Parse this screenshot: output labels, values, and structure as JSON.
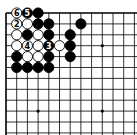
{
  "board": {
    "type": "go-diagram",
    "origin": {
      "x": 6,
      "y": 13
    },
    "spacing": {
      "x": 10.7,
      "y": 10.9
    },
    "columns_visible": 13,
    "rows_visible": 12,
    "edges": {
      "top": true,
      "left": true,
      "right": false,
      "bottom": false
    },
    "star_points": [
      {
        "col": 3,
        "row": 3
      },
      {
        "col": 9,
        "row": 3
      },
      {
        "col": 3,
        "row": 9
      },
      {
        "col": 9,
        "row": 9
      }
    ],
    "colors": {
      "line": "#000000",
      "black": "#000000",
      "white": "#ffffff",
      "background": "#ffffff"
    },
    "stones": [
      {
        "col": 1,
        "row": 0,
        "color": "white",
        "label": "6"
      },
      {
        "col": 2,
        "row": 0,
        "color": "black",
        "label": "5"
      },
      {
        "col": 3,
        "row": 0,
        "color": "black",
        "label": ""
      },
      {
        "col": 1,
        "row": 1,
        "color": "white",
        "label": "2"
      },
      {
        "col": 2,
        "row": 1,
        "color": "white",
        "label": ""
      },
      {
        "col": 3,
        "row": 1,
        "color": "black",
        "label": ""
      },
      {
        "col": 4,
        "row": 1,
        "color": "black",
        "label": ""
      },
      {
        "col": 7,
        "row": 1,
        "color": "black",
        "label": ""
      },
      {
        "col": 1,
        "row": 2,
        "color": "white",
        "label": ""
      },
      {
        "col": 2,
        "row": 2,
        "color": "black",
        "label": ""
      },
      {
        "col": 3,
        "row": 2,
        "color": "white",
        "label": ""
      },
      {
        "col": 4,
        "row": 2,
        "color": "black",
        "label": ""
      },
      {
        "col": 6,
        "row": 2,
        "color": "black",
        "label": ""
      },
      {
        "col": 1,
        "row": 3,
        "color": "white",
        "label": ""
      },
      {
        "col": 2,
        "row": 3,
        "color": "white",
        "label": "4"
      },
      {
        "col": 3,
        "row": 3,
        "color": "white",
        "label": ""
      },
      {
        "col": 4,
        "row": 3,
        "color": "black",
        "label": "3"
      },
      {
        "col": 5,
        "row": 3,
        "color": "white",
        "label": ""
      },
      {
        "col": 6,
        "row": 3,
        "color": "black",
        "label": ""
      },
      {
        "col": 1,
        "row": 4,
        "color": "black",
        "label": ""
      },
      {
        "col": 2,
        "row": 4,
        "color": "white",
        "label": ""
      },
      {
        "col": 3,
        "row": 4,
        "color": "white",
        "label": ""
      },
      {
        "col": 4,
        "row": 4,
        "color": "black",
        "label": ""
      },
      {
        "col": 6,
        "row": 4,
        "color": "black",
        "label": ""
      },
      {
        "col": 1,
        "row": 5,
        "color": "black",
        "label": ""
      },
      {
        "col": 2,
        "row": 5,
        "color": "black",
        "label": ""
      },
      {
        "col": 3,
        "row": 5,
        "color": "black",
        "label": ""
      },
      {
        "col": 4,
        "row": 5,
        "color": "black",
        "label": ""
      }
    ]
  }
}
